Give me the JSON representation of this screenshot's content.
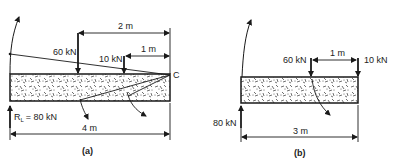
{
  "diagrams": [
    {
      "caption": "(a)",
      "reaction_label": "R",
      "reaction_subscript": "L",
      "reaction_value": "= 80 kN",
      "loads": [
        {
          "label": "60 kN"
        },
        {
          "label": "10 kN"
        }
      ],
      "point_label": "C",
      "dimensions": {
        "two_m": "2 m",
        "one_m": "1 m",
        "four_m": "4 m"
      }
    },
    {
      "caption": "(b)",
      "reaction_label": "80 kN",
      "loads": [
        {
          "label": "60 kN"
        },
        {
          "label": "10 kN"
        }
      ],
      "dimensions": {
        "one_m": "1 m",
        "three_m": "3 m"
      }
    }
  ],
  "colors": {
    "ink": "#1a1a1a",
    "background": "#ffffff"
  }
}
